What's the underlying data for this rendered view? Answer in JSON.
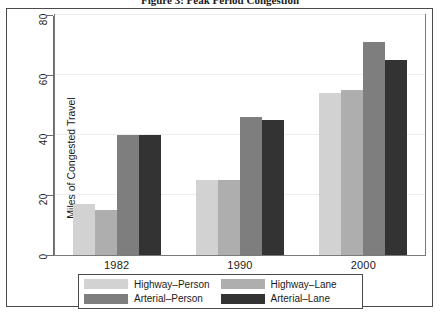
{
  "figure": {
    "title": "Figure 3: Peak Period Congestion"
  },
  "chart_data": {
    "type": "bar",
    "title": "Figure 3: Peak Period Congestion",
    "xlabel": "",
    "ylabel": "Miles of Congested Travel",
    "categories": [
      "1982",
      "1990",
      "2000"
    ],
    "yticks": [
      0,
      20,
      40,
      60,
      80
    ],
    "ylim": [
      0,
      80
    ],
    "grid": true,
    "legend_position": "bottom",
    "series": [
      {
        "name": "Highway-Person",
        "color": "#d2d2d2",
        "values": [
          17,
          25,
          54
        ]
      },
      {
        "name": "Highway-Lane",
        "color": "#aeaeae",
        "values": [
          15,
          25,
          55
        ]
      },
      {
        "name": "Arterial-Person",
        "color": "#7e7e7e",
        "values": [
          40,
          46,
          71
        ]
      },
      {
        "name": "Arterial-Lane",
        "color": "#333333",
        "values": [
          40,
          45,
          65
        ]
      }
    ]
  },
  "legend": {
    "entries": [
      {
        "label": "Highway-Person",
        "color": "#d2d2d2"
      },
      {
        "label": "Highway-Lane",
        "color": "#aeaeae"
      },
      {
        "label": "Arterial-Person",
        "color": "#7e7e7e"
      },
      {
        "label": "Arterial-Lane",
        "color": "#333333"
      }
    ]
  }
}
